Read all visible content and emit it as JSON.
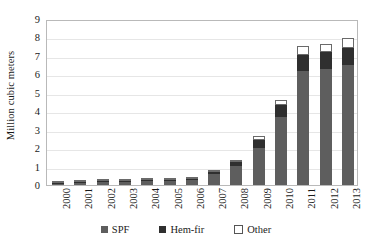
{
  "chart_data": {
    "type": "bar",
    "title": "",
    "xlabel": "",
    "ylabel": "Million cubic meters",
    "ylim": [
      0,
      9
    ],
    "yticks": [
      0,
      1,
      2,
      3,
      4,
      5,
      6,
      7,
      8,
      9
    ],
    "grid": true,
    "stacked": true,
    "legend_position": "bottom",
    "categories": [
      "2000",
      "2001",
      "2002",
      "2003",
      "2004",
      "2005",
      "2006",
      "2007",
      "2008",
      "2009",
      "2010",
      "2011",
      "2012",
      "2013"
    ],
    "series": [
      {
        "name": "SPF",
        "color": "#5e5e5e",
        "values": [
          0.06,
          0.09,
          0.14,
          0.16,
          0.2,
          0.2,
          0.28,
          0.6,
          1.05,
          2.0,
          3.7,
          6.2,
          6.3,
          6.5
        ]
      },
      {
        "name": "Hem-fir",
        "color": "#2f2f2f",
        "values": [
          0.02,
          0.02,
          0.03,
          0.03,
          0.04,
          0.04,
          0.05,
          0.1,
          0.2,
          0.45,
          0.65,
          0.85,
          0.9,
          0.95
        ]
      },
      {
        "name": "Other",
        "color": "#ffffff",
        "values": [
          0.01,
          0.01,
          0.01,
          0.01,
          0.01,
          0.01,
          0.02,
          0.05,
          0.1,
          0.2,
          0.25,
          0.5,
          0.45,
          0.5
        ]
      }
    ],
    "totals": [
      0.09,
      0.12,
      0.18,
      0.2,
      0.25,
      0.25,
      0.35,
      0.75,
      1.35,
      2.65,
      4.6,
      7.55,
      7.65,
      7.95
    ]
  },
  "legend": {
    "items": [
      {
        "label": "SPF"
      },
      {
        "label": "Hem-fir"
      },
      {
        "label": "Other"
      }
    ]
  },
  "axis": {
    "y_title": "Million cubic meters"
  }
}
